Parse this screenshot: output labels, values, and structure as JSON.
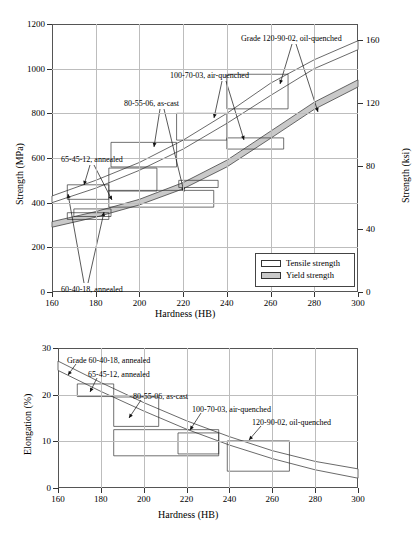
{
  "figure": {
    "title": "",
    "panels": [
      "strength-vs-hardness",
      "elongation-vs-hardness"
    ]
  },
  "legend": {
    "tensile_label": "Tensile strength",
    "yield_label": "Yield strength",
    "tensile_color": "#ffffff",
    "yield_color": "#c9c9c9"
  },
  "chart_data": [
    {
      "id": "strength-vs-hardness",
      "type": "line",
      "title": "",
      "xlabel": "Hardness (HB)",
      "ylabel": "Strength (MPa)",
      "y2label": "Strength (ksi)",
      "xlim": [
        160,
        300
      ],
      "ylim": [
        0,
        1200
      ],
      "y2lim": [
        0,
        170
      ],
      "xticks": [
        160,
        180,
        200,
        220,
        240,
        260,
        280,
        300
      ],
      "yticks": [
        0,
        200,
        400,
        600,
        800,
        1000,
        1200
      ],
      "y2ticks": [
        0,
        40,
        80,
        120,
        160
      ],
      "grid": true,
      "legend_position": "lower-right",
      "series": [
        {
          "name": "Tensile strength band",
          "kind": "band",
          "fill": "#ffffff",
          "upper": [
            [
              160,
              430
            ],
            [
              180,
              500
            ],
            [
              200,
              580
            ],
            [
              220,
              680
            ],
            [
              240,
              800
            ],
            [
              260,
              935
            ],
            [
              280,
              1040
            ],
            [
              300,
              1125
            ]
          ],
          "lower": [
            [
              160,
              400
            ],
            [
              180,
              465
            ],
            [
              200,
              545
            ],
            [
              220,
              640
            ],
            [
              240,
              755
            ],
            [
              260,
              880
            ],
            [
              280,
              1000
            ],
            [
              300,
              1085
            ]
          ]
        },
        {
          "name": "Yield strength band",
          "kind": "band",
          "fill": "#c9c9c9",
          "upper": [
            [
              160,
              315
            ],
            [
              180,
              360
            ],
            [
              200,
              415
            ],
            [
              220,
              490
            ],
            [
              240,
              590
            ],
            [
              260,
              720
            ],
            [
              280,
              850
            ],
            [
              300,
              950
            ]
          ],
          "lower": [
            [
              160,
              290
            ],
            [
              180,
              335
            ],
            [
              200,
              390
            ],
            [
              220,
              462
            ],
            [
              240,
              560
            ],
            [
              260,
              688
            ],
            [
              280,
              818
            ],
            [
              300,
              918
            ]
          ]
        }
      ],
      "grade_boxes": [
        {
          "grade": "60-40-18, annealed",
          "property": "tensile",
          "hb_range": [
            167,
            186
          ],
          "strength_range": [
            415,
            480
          ]
        },
        {
          "grade": "60-40-18, annealed",
          "property": "yield",
          "hb_range": [
            167,
            186
          ],
          "strength_range": [
            325,
            355
          ]
        },
        {
          "grade": "65-45-12, annealed",
          "property": "tensile",
          "hb_range": [
            186,
            208
          ],
          "strength_range": [
            452,
            555
          ]
        },
        {
          "grade": "65-45-12, annealed",
          "property": "yield",
          "hb_range": [
            170,
            187
          ],
          "strength_range": [
            338,
            372
          ]
        },
        {
          "grade": "80-55-06, as-cast",
          "property": "tensile",
          "hb_range": [
            187,
            217
          ],
          "strength_range": [
            560,
            670
          ]
        },
        {
          "grade": "80-55-06, as-cast",
          "property": "yield",
          "hb_range": [
            186,
            234
          ],
          "strength_range": [
            380,
            455
          ]
        },
        {
          "grade": "100-70-03, air-quenched",
          "property": "tensile",
          "hb_range": [
            217,
            240
          ],
          "strength_range": [
            680,
            800
          ]
        },
        {
          "grade": "100-70-03, air-quenched",
          "property": "yield",
          "hb_range": [
            218,
            236
          ],
          "strength_range": [
            468,
            500
          ]
        },
        {
          "grade": "120-90-02, oil-quenched",
          "property": "tensile",
          "hb_range": [
            240,
            268
          ],
          "strength_range": [
            820,
            975
          ]
        },
        {
          "grade": "120-90-02, oil-quenched",
          "property": "yield",
          "hb_range": [
            240,
            266
          ],
          "strength_range": [
            640,
            690
          ]
        }
      ],
      "annotations": [
        {
          "text": "Grade 120-90-02, oil-quenched",
          "points_to": [
            "tensile band",
            "yield band"
          ]
        },
        {
          "text": "100-70-03, air-quenched",
          "points_to": [
            "tensile band",
            "yield band"
          ]
        },
        {
          "text": "80-55-06, as-cast",
          "points_to": [
            "tensile band",
            "yield band"
          ]
        },
        {
          "text": "65-45-12, annealed",
          "points_to": [
            "tensile band",
            "yield band"
          ]
        },
        {
          "text": "60-40-18, annealed",
          "points_to": [
            "tensile band",
            "yield band"
          ]
        }
      ]
    },
    {
      "id": "elongation-vs-hardness",
      "type": "line",
      "title": "",
      "xlabel": "Hardness (HB)",
      "ylabel": "Elongation (%)",
      "xlim": [
        160,
        300
      ],
      "ylim": [
        0,
        30
      ],
      "xticks": [
        160,
        180,
        200,
        220,
        240,
        260,
        280,
        300
      ],
      "yticks": [
        0,
        10,
        20,
        30
      ],
      "grid": true,
      "legend_position": "none",
      "series": [
        {
          "name": "Elongation band",
          "kind": "band",
          "fill": "#ffffff",
          "upper": [
            [
              160,
              27.2
            ],
            [
              180,
              22.6
            ],
            [
              200,
              18.3
            ],
            [
              220,
              14.4
            ],
            [
              240,
              11.0
            ],
            [
              260,
              8.0
            ],
            [
              280,
              5.7
            ],
            [
              300,
              4.1
            ]
          ],
          "lower": [
            [
              160,
              25.2
            ],
            [
              180,
              20.7
            ],
            [
              200,
              16.5
            ],
            [
              220,
              12.6
            ],
            [
              240,
              9.2
            ],
            [
              260,
              6.3
            ],
            [
              280,
              3.9
            ],
            [
              300,
              2.1
            ]
          ]
        }
      ],
      "grade_boxes": [
        {
          "grade": "60-40-18, annealed",
          "hb_range": [
            169,
            186
          ],
          "elongation_range": [
            19.6,
            22.3
          ]
        },
        {
          "grade": "65-45-12, annealed",
          "hb_range": [
            186,
            207
          ],
          "elongation_range": [
            13.2,
            19.5
          ]
        },
        {
          "grade": "80-55-06, as-cast",
          "hb_range": [
            186,
            235
          ],
          "elongation_range": [
            6.9,
            12.5
          ]
        },
        {
          "grade": "100-70-03, air-quenched",
          "hb_range": [
            216,
            235
          ],
          "elongation_range": [
            7.3,
            11.8
          ]
        },
        {
          "grade": "120-90-02, oil-quenched",
          "hb_range": [
            239,
            268
          ],
          "elongation_range": [
            3.6,
            10.1
          ]
        }
      ],
      "annotations": [
        {
          "text": "Grade 60-40-18, annealed"
        },
        {
          "text": "65-45-12, annealed"
        },
        {
          "text": "80-55-06, as-cast"
        },
        {
          "text": "100-70-03, air-quenched"
        },
        {
          "text": "120-90-02, oil-quenched"
        }
      ]
    }
  ]
}
